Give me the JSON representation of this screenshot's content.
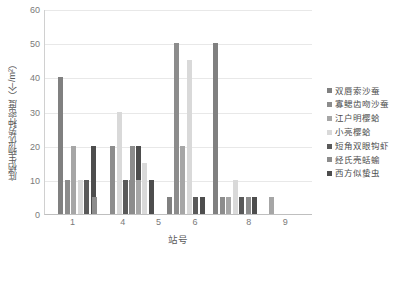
{
  "chart_data": {
    "type": "bar",
    "title": "",
    "xlabel": "站号",
    "ylabel": "底栖生物优势种密度（个/m²）",
    "ylim": [
      0,
      60
    ],
    "yticks": [
      0,
      10,
      20,
      30,
      40,
      50,
      60
    ],
    "grid": true,
    "legend_position": "right",
    "categories": [
      "1",
      "4",
      "5",
      "6",
      "8",
      "9"
    ],
    "xtick_positions": [
      1,
      4,
      5,
      6,
      8,
      9
    ],
    "series": [
      {
        "name": "双唇索沙蚕",
        "color": "#808080",
        "values_by_station": {
          "1": 40,
          "2": 0,
          "3": 0,
          "4": 0,
          "5": 0,
          "6": 5,
          "7": 50,
          "8": 0,
          "9": 0
        }
      },
      {
        "name": "寡鳃齿吻沙蚕",
        "color": "#8c8c8c",
        "values_by_station": {
          "1": 10,
          "2": 0,
          "3": 20,
          "4": 0,
          "5": 10,
          "6": 50,
          "7": 5,
          "8": 5,
          "9": 0
        }
      },
      {
        "name": "江户明樱蛤",
        "color": "#a6a6a6",
        "values_by_station": {
          "1": 20,
          "2": 0,
          "3": 0,
          "4": 0,
          "5": 10,
          "6": 20,
          "7": 5,
          "8": 5,
          "9": 5
        }
      },
      {
        "name": "小亮樱蛤",
        "color": "#d9d9d9",
        "values_by_station": {
          "1": 10,
          "2": 0,
          "3": 30,
          "4": 0,
          "5": 15,
          "6": 45,
          "7": 5,
          "8": 10,
          "9": 0
        }
      },
      {
        "name": "短角双眼钩虾",
        "color": "#595959",
        "values_by_station": {
          "1": 10,
          "2": 5,
          "3": 10,
          "4": 20,
          "5": 0,
          "6": 5,
          "7": 5,
          "8": 5,
          "9": 0
        }
      },
      {
        "name": "经氏壳蛞蝓",
        "color": "#8c8c8c",
        "values_by_station": {
          "1": 0,
          "2": 0,
          "3": 20,
          "4": 0,
          "5": 0,
          "6": 0,
          "7": 5,
          "8": 5,
          "9": 0
        }
      },
      {
        "name": "西方似蛰虫",
        "color": "#4d4d4d",
        "values_by_station": {
          "1": 20,
          "2": 0,
          "3": 20,
          "4": 10,
          "5": 0,
          "6": 5,
          "7": 0,
          "8": 5,
          "9": 0
        }
      }
    ],
    "bars": [
      {
        "series": 0,
        "group": 0,
        "slot": 0,
        "value": 40,
        "color": "#808080"
      },
      {
        "series": 1,
        "group": 0,
        "slot": 1,
        "value": 10,
        "color": "#8c8c8c"
      },
      {
        "series": 2,
        "group": 0,
        "slot": 2,
        "value": 20,
        "color": "#a6a6a6"
      },
      {
        "series": 3,
        "group": 0,
        "slot": 3,
        "value": 10,
        "color": "#d9d9d9"
      },
      {
        "series": 4,
        "group": 0,
        "slot": 4,
        "value": 10,
        "color": "#595959"
      },
      {
        "series": 6,
        "group": 0,
        "slot": 5,
        "value": 20,
        "color": "#4d4d4d"
      },
      {
        "series": 4,
        "group": 1,
        "slot": 0,
        "value": 5,
        "color": "#8c8c8c"
      },
      {
        "series": 1,
        "group": 2,
        "slot": 0,
        "value": 20,
        "color": "#8c8c8c"
      },
      {
        "series": 3,
        "group": 2,
        "slot": 1,
        "value": 30,
        "color": "#d9d9d9"
      },
      {
        "series": 4,
        "group": 2,
        "slot": 2,
        "value": 10,
        "color": "#595959"
      },
      {
        "series": 5,
        "group": 2,
        "slot": 3,
        "value": 20,
        "color": "#8c8c8c"
      },
      {
        "series": 6,
        "group": 2,
        "slot": 4,
        "value": 20,
        "color": "#4d4d4d"
      },
      {
        "series": 1,
        "group": 3,
        "slot": 0,
        "value": 10,
        "color": "#8c8c8c"
      },
      {
        "series": 2,
        "group": 3,
        "slot": 1,
        "value": 10,
        "color": "#a6a6a6"
      },
      {
        "series": 3,
        "group": 3,
        "slot": 2,
        "value": 15,
        "color": "#d9d9d9"
      },
      {
        "series": 6,
        "group": 3,
        "slot": 3,
        "value": 10,
        "color": "#4d4d4d"
      },
      {
        "series": 0,
        "group": 4,
        "slot": 0,
        "value": 5,
        "color": "#808080"
      },
      {
        "series": 1,
        "group": 4,
        "slot": 1,
        "value": 50,
        "color": "#8c8c8c"
      },
      {
        "series": 2,
        "group": 4,
        "slot": 2,
        "value": 20,
        "color": "#a6a6a6"
      },
      {
        "series": 3,
        "group": 4,
        "slot": 3,
        "value": 45,
        "color": "#d9d9d9"
      },
      {
        "series": 4,
        "group": 4,
        "slot": 4,
        "value": 5,
        "color": "#595959"
      },
      {
        "series": 6,
        "group": 4,
        "slot": 5,
        "value": 5,
        "color": "#4d4d4d"
      },
      {
        "series": 0,
        "group": 5,
        "slot": 0,
        "value": 50,
        "color": "#808080"
      },
      {
        "series": 1,
        "group": 5,
        "slot": 1,
        "value": 5,
        "color": "#8c8c8c"
      },
      {
        "series": 2,
        "group": 5,
        "slot": 2,
        "value": 5,
        "color": "#a6a6a6"
      },
      {
        "series": 3,
        "group": 5,
        "slot": 3,
        "value": 10,
        "color": "#d9d9d9"
      },
      {
        "series": 4,
        "group": 5,
        "slot": 4,
        "value": 5,
        "color": "#595959"
      },
      {
        "series": 5,
        "group": 5,
        "slot": 5,
        "value": 5,
        "color": "#8c8c8c"
      },
      {
        "series": 6,
        "group": 5,
        "slot": 6,
        "value": 5,
        "color": "#4d4d4d"
      },
      {
        "series": 2,
        "group": 6,
        "slot": 0,
        "value": 5,
        "color": "#a6a6a6"
      }
    ],
    "bar_layout": {
      "group_starts_px": [
        13,
        47,
        65,
        84,
        122,
        168,
        224
      ],
      "bar_width_px": 5,
      "bar_gap_px": 1.5
    }
  },
  "legend": {
    "items": [
      {
        "label": "双唇索沙蚕",
        "color": "#808080"
      },
      {
        "label": "寡鳃齿吻沙蚕",
        "color": "#8c8c8c"
      },
      {
        "label": "江户明樱蛤",
        "color": "#a6a6a6"
      },
      {
        "label": "小亮樱蛤",
        "color": "#d9d9d9"
      },
      {
        "label": "短角双眼钩虾",
        "color": "#595959"
      },
      {
        "label": "经氏壳蛞蝓",
        "color": "#8c8c8c"
      },
      {
        "label": "西方似蛰虫",
        "color": "#4d4d4d"
      }
    ]
  }
}
